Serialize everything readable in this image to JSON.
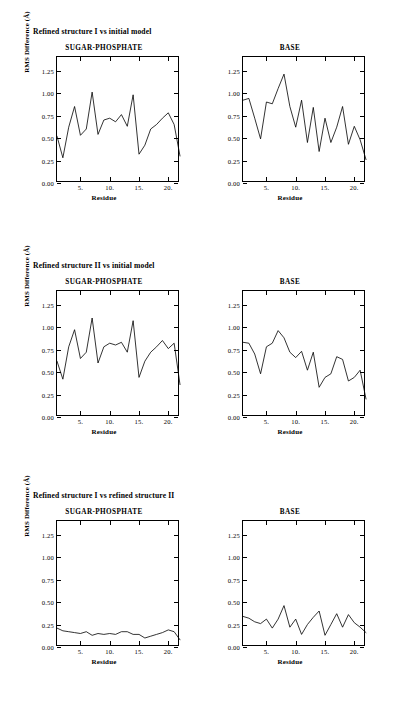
{
  "figure": {
    "panels": [
      {
        "title": "Refined structure I vs initial model",
        "title_top": 27,
        "charts_top": 44
      },
      {
        "title": "Refined structure II vs initial model",
        "title_top": 261,
        "charts_top": 278
      },
      {
        "title": "Refined structure I vs refined structure II",
        "title_top": 491,
        "charts_top": 508
      }
    ]
  },
  "axes": {
    "ylabel": "RMS Difference (Å)",
    "xlabel": "Residue",
    "yticks": [
      "0.00",
      "0.25",
      "0.50",
      "0.75",
      "1.00",
      "1.25"
    ],
    "ytick_values": [
      0.0,
      0.25,
      0.5,
      0.75,
      1.0,
      1.25
    ],
    "xticks": [
      "5.",
      "10.",
      "15.",
      "20."
    ],
    "xtick_values": [
      5,
      10,
      15,
      20
    ],
    "ylim": [
      0.0,
      1.4
    ],
    "xlim": [
      1,
      22
    ]
  },
  "chart_data": [
    {
      "type": "line",
      "panel": "Refined structure I vs initial model",
      "title": "SUGAR-PHOSPHATE",
      "xlabel": "Residue",
      "ylabel": "RMS Difference (Å)",
      "ylim": [
        0.0,
        1.4
      ],
      "xlim": [
        1,
        22
      ],
      "grid": false,
      "legend": "none",
      "x": [
        1,
        2,
        3,
        4,
        5,
        6,
        7,
        8,
        9,
        10,
        11,
        12,
        13,
        14,
        15,
        16,
        17,
        18,
        19,
        20,
        21,
        22
      ],
      "values": [
        0.52,
        0.28,
        0.62,
        0.85,
        0.53,
        0.6,
        1.01,
        0.54,
        0.7,
        0.72,
        0.68,
        0.76,
        0.63,
        0.98,
        0.32,
        0.42,
        0.6,
        0.65,
        0.72,
        0.78,
        0.65,
        0.3
      ]
    },
    {
      "type": "line",
      "panel": "Refined structure I vs initial model",
      "title": "BASE",
      "xlabel": "Residue",
      "ylabel": "RMS Difference (Å)",
      "ylim": [
        0.0,
        1.4
      ],
      "xlim": [
        1,
        22
      ],
      "grid": false,
      "legend": "none",
      "x": [
        1,
        2,
        3,
        4,
        5,
        6,
        7,
        8,
        9,
        10,
        11,
        12,
        13,
        14,
        15,
        16,
        17,
        18,
        19,
        20,
        21,
        22
      ],
      "values": [
        0.92,
        0.94,
        0.72,
        0.49,
        0.9,
        0.88,
        1.05,
        1.21,
        0.85,
        0.62,
        0.92,
        0.45,
        0.84,
        0.35,
        0.72,
        0.45,
        0.62,
        0.85,
        0.43,
        0.63,
        0.48,
        0.26
      ]
    },
    {
      "type": "line",
      "panel": "Refined structure II vs initial model",
      "title": "SUGAR-PHOSPHATE",
      "xlabel": "Residue",
      "ylabel": "RMS Difference (Å)",
      "ylim": [
        0.0,
        1.4
      ],
      "xlim": [
        1,
        22
      ],
      "grid": false,
      "legend": "none",
      "x": [
        1,
        2,
        3,
        4,
        5,
        6,
        7,
        8,
        9,
        10,
        11,
        12,
        13,
        14,
        15,
        16,
        17,
        18,
        19,
        20,
        21,
        22
      ],
      "values": [
        0.62,
        0.42,
        0.78,
        0.97,
        0.65,
        0.72,
        1.1,
        0.6,
        0.78,
        0.82,
        0.8,
        0.83,
        0.72,
        1.07,
        0.44,
        0.62,
        0.72,
        0.78,
        0.85,
        0.76,
        0.82,
        0.36
      ]
    },
    {
      "type": "line",
      "panel": "Refined structure II vs initial model",
      "title": "BASE",
      "xlabel": "Residue",
      "ylabel": "RMS Difference (Å)",
      "ylim": [
        0.0,
        1.4
      ],
      "xlim": [
        1,
        22
      ],
      "grid": false,
      "legend": "none",
      "x": [
        1,
        2,
        3,
        4,
        5,
        6,
        7,
        8,
        9,
        10,
        11,
        12,
        13,
        14,
        15,
        16,
        17,
        18,
        19,
        20,
        21,
        22
      ],
      "values": [
        0.83,
        0.82,
        0.7,
        0.48,
        0.78,
        0.82,
        0.96,
        0.88,
        0.72,
        0.66,
        0.73,
        0.52,
        0.72,
        0.33,
        0.44,
        0.48,
        0.67,
        0.64,
        0.4,
        0.44,
        0.52,
        0.2
      ]
    },
    {
      "type": "line",
      "panel": "Refined structure I vs refined structure II",
      "title": "SUGAR-PHOSPHATE",
      "xlabel": "Residue",
      "ylabel": "RMS Difference (Å)",
      "ylim": [
        0.0,
        1.4
      ],
      "xlim": [
        1,
        22
      ],
      "grid": false,
      "legend": "none",
      "x": [
        1,
        2,
        3,
        4,
        5,
        6,
        7,
        8,
        9,
        10,
        11,
        12,
        13,
        14,
        15,
        16,
        17,
        18,
        19,
        20,
        21,
        22
      ],
      "values": [
        0.21,
        0.18,
        0.17,
        0.16,
        0.15,
        0.17,
        0.13,
        0.15,
        0.14,
        0.15,
        0.14,
        0.17,
        0.17,
        0.14,
        0.14,
        0.1,
        0.12,
        0.14,
        0.16,
        0.19,
        0.17,
        0.08
      ]
    },
    {
      "type": "line",
      "panel": "Refined structure I vs refined structure II",
      "title": "BASE",
      "xlabel": "Residue",
      "ylabel": "RMS Difference (Å)",
      "ylim": [
        0.0,
        1.4
      ],
      "xlim": [
        1,
        22
      ],
      "grid": false,
      "legend": "none",
      "x": [
        1,
        2,
        3,
        4,
        5,
        6,
        7,
        8,
        9,
        10,
        11,
        12,
        13,
        14,
        15,
        16,
        17,
        18,
        19,
        20,
        21,
        22
      ],
      "values": [
        0.34,
        0.32,
        0.28,
        0.26,
        0.31,
        0.21,
        0.31,
        0.46,
        0.22,
        0.31,
        0.14,
        0.25,
        0.33,
        0.4,
        0.13,
        0.25,
        0.37,
        0.22,
        0.36,
        0.27,
        0.22,
        0.16
      ]
    }
  ]
}
